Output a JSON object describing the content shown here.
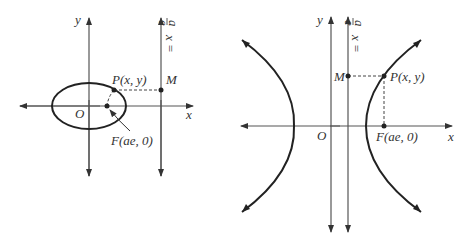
{
  "figures": [
    {
      "name": "ellipse",
      "labels": {
        "y_axis": "y",
        "x_axis": "x",
        "origin": "O",
        "point_p": "P(x, y)",
        "point_m": "M",
        "focus": "F(ae, 0)",
        "directrix_lhs": "x =",
        "directrix_num": "a",
        "directrix_den": "e"
      }
    },
    {
      "name": "hyperbola",
      "labels": {
        "y_axis": "y",
        "x_axis": "x",
        "origin": "O",
        "point_p": "P(x, y)",
        "point_m": "M",
        "focus": "F(ae, 0)",
        "directrix_lhs": "x =",
        "directrix_num": "a",
        "directrix_den": "e"
      }
    }
  ],
  "colors": {
    "curve": "#222222",
    "axis": "#555555",
    "text": "#333333",
    "background": "#ffffff"
  }
}
